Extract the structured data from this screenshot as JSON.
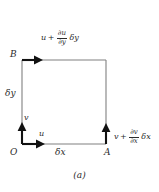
{
  "figure": {
    "caption": "(a)",
    "background_color": "#ffffff",
    "rectangle_color": "#808080",
    "arrow_color": "#111111",
    "points": {
      "O": "O",
      "A": "A",
      "B": "B"
    },
    "side_labels": {
      "bottom": "δx",
      "left": "δy"
    },
    "origin_vectors": {
      "horizontal": "u",
      "vertical": "v"
    },
    "top_expression": {
      "base": "u",
      "operator": "+",
      "numerator": "∂u",
      "denominator": "∂y",
      "tail": "δy"
    },
    "right_expression": {
      "base": "v",
      "operator": "+",
      "numerator": "∂v",
      "denominator": "∂x",
      "tail": "δx"
    },
    "geometry": {
      "left_x": 22,
      "right_x": 106,
      "top_y": 60,
      "bottom_y": 144
    }
  }
}
